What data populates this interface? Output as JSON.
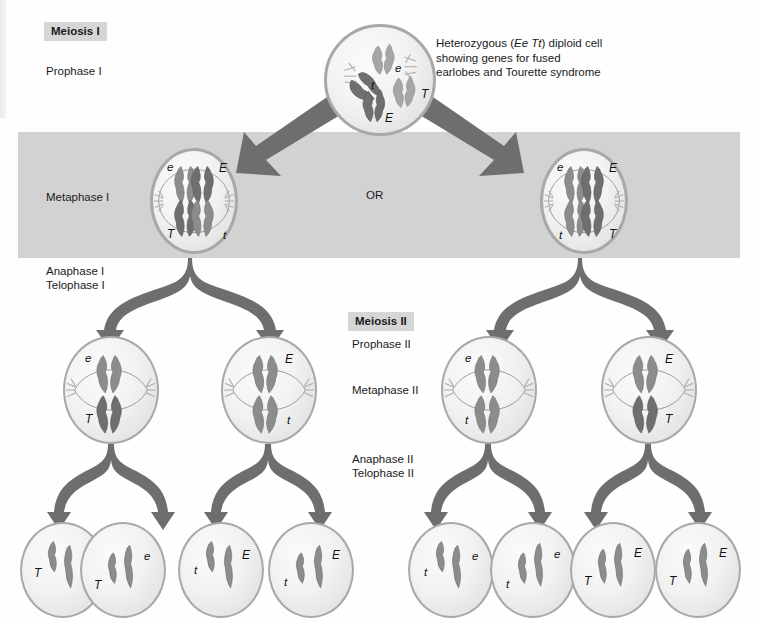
{
  "diagram": {
    "stage_labels": {
      "meiosis_i": "Meiosis I",
      "prophase_i": "Prophase I",
      "metaphase_i": "Metaphase I",
      "anaphase_i": "Anaphase I",
      "telophase_i": "Telophase I",
      "meiosis_ii": "Meiosis II",
      "prophase_ii": "Prophase II",
      "metaphase_ii": "Metaphase II",
      "anaphase_ii": "Anaphase II",
      "telophase_ii": "Telophase II",
      "or": "OR"
    },
    "callout": {
      "line1_pre": "Heterozygous (",
      "line1_italic": "Ee Tt",
      "line1_post": ") diploid cell",
      "line2": "showing genes for fused",
      "line3": "earlobes and Tourette syndrome"
    },
    "colors": {
      "band": "#d2d2d2",
      "heading_bg": "#d6d6d6",
      "cell_border": "#a8a8a8",
      "arrow": "#6e6e6e",
      "chromosome_dark": "#6f6f6f",
      "chromosome_light": "#a6a6a6",
      "text": "#1a1a1a"
    },
    "prophase_i_cell": {
      "name": "prophase-i-cell",
      "alleles": [
        "e",
        "t",
        "T",
        "E"
      ]
    },
    "metaphase_i_cells": [
      {
        "name": "metaphase-i-cell-left",
        "top_left": "e",
        "top_right": "E",
        "bottom_left": "T",
        "bottom_right": "t"
      },
      {
        "name": "metaphase-i-cell-right",
        "top_left": "e",
        "top_right": "E",
        "bottom_left": "t",
        "bottom_right": "T"
      }
    ],
    "metaphase_ii_cells": [
      {
        "name": "metaphase-ii-cell-1",
        "top": "e",
        "bottom": "T",
        "side": "left"
      },
      {
        "name": "metaphase-ii-cell-2",
        "top": "E",
        "bottom": "t",
        "side": "right"
      },
      {
        "name": "metaphase-ii-cell-3",
        "top": "e",
        "bottom": "t",
        "side": "left"
      },
      {
        "name": "metaphase-ii-cell-4",
        "top": "E",
        "bottom": "T",
        "side": "right"
      }
    ],
    "gamete_cells": [
      {
        "name": "gamete-1",
        "left_allele": "T",
        "right_allele": "e"
      },
      {
        "name": "gamete-2",
        "left_allele": "T",
        "right_allele": "e"
      },
      {
        "name": "gamete-3",
        "left_allele": "t",
        "right_allele": "E"
      },
      {
        "name": "gamete-4",
        "left_allele": "t",
        "right_allele": "E"
      },
      {
        "name": "gamete-5",
        "left_allele": "t",
        "right_allele": "e"
      },
      {
        "name": "gamete-6",
        "left_allele": "t",
        "right_allele": "e"
      },
      {
        "name": "gamete-7",
        "left_allele": "T",
        "right_allele": "E"
      },
      {
        "name": "gamete-8",
        "left_allele": "T",
        "right_allele": "E"
      }
    ]
  }
}
